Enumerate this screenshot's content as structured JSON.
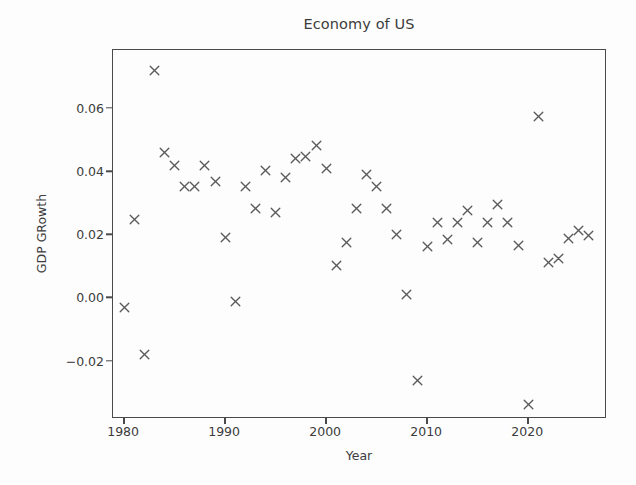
{
  "figure": {
    "title": "Economy of US",
    "background": "#fdfdfd",
    "marker_color": "#5a5a5a",
    "axis_color": "#4a4a4a"
  },
  "chart_data": {
    "type": "scatter",
    "title": "Economy of US",
    "xlabel": "Year",
    "ylabel": "GDP GRowth",
    "marker": "x",
    "grid": false,
    "legend": null,
    "xlim": [
      1978.9,
      2027.8
    ],
    "ylim": [
      -0.0382,
      0.0787
    ],
    "xticks": [
      1980,
      1990,
      2000,
      2010,
      2020
    ],
    "xticklabels": [
      "1980",
      "1990",
      "2000",
      "2010",
      "2020"
    ],
    "yticks": [
      -0.02,
      0.0,
      0.02,
      0.04,
      0.06
    ],
    "yticklabels": [
      "-0.02",
      "0.00",
      "0.02",
      "0.04",
      "0.06"
    ],
    "x": [
      1980,
      1981,
      1982,
      1983,
      1984,
      1985,
      1986,
      1987,
      1988,
      1989,
      1990,
      1991,
      1992,
      1993,
      1994,
      1995,
      1996,
      1997,
      1998,
      1999,
      2000,
      2001,
      2002,
      2003,
      2004,
      2005,
      2006,
      2007,
      2008,
      2009,
      2010,
      2011,
      2012,
      2013,
      2014,
      2015,
      2016,
      2017,
      2018,
      2019,
      2020,
      2021,
      2022,
      2023,
      2024,
      2025,
      2026
    ],
    "y": [
      -0.003,
      0.025,
      -0.0178,
      0.0722,
      0.0462,
      0.0421,
      0.0354,
      0.0354,
      0.0421,
      0.0371,
      0.0192,
      -0.0009,
      0.0354,
      0.0286,
      0.0404,
      0.0273,
      0.0383,
      0.0443,
      0.0449,
      0.0484,
      0.0412,
      0.0104,
      0.0176,
      0.0286,
      0.0391,
      0.0354,
      0.0286,
      0.0204,
      0.0013,
      -0.026,
      0.0165,
      0.0239,
      0.0186,
      0.0239,
      0.0277,
      0.0176,
      0.0239,
      0.0297,
      0.0239,
      0.0169,
      -0.0335,
      0.0577,
      0.0113,
      0.0126,
      0.019,
      0.0215,
      0.0198
    ]
  }
}
